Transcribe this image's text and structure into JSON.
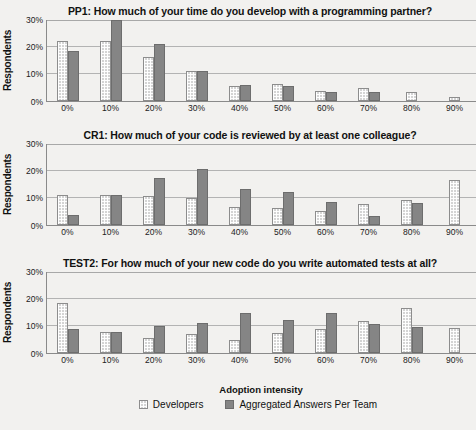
{
  "figure": {
    "axis_title": "Adoption intensity",
    "y_axis_title": "Respondents",
    "y_ticks": [
      "0%",
      "10%",
      "20%",
      "30%"
    ],
    "legend": [
      {
        "label": "Developers",
        "swatch": "light-dotted",
        "color": "#d4d4d4"
      },
      {
        "label": "Aggregated Answers Per Team",
        "swatch": "dark-solid",
        "color": "#858585"
      }
    ]
  },
  "chart_data": [
    {
      "type": "bar",
      "title": "PP1: How much of your time do you develop with a programming partner?",
      "xlabel": "Adoption intensity",
      "ylabel": "Respondents",
      "ylim": [
        0,
        30
      ],
      "yticks": [
        0,
        10,
        20,
        30
      ],
      "grid": true,
      "legend_position": "bottom",
      "categories": [
        "0%",
        "10%",
        "20%",
        "30%",
        "40%",
        "50%",
        "60%",
        "70%",
        "80%",
        "90%"
      ],
      "series": [
        {
          "name": "Developers",
          "values": [
            22.0,
            22.2,
            16.0,
            10.8,
            5.2,
            6.3,
            3.7,
            4.5,
            3.0,
            1.2
          ]
        },
        {
          "name": "Aggregated Answers Per Team",
          "values": [
            18.5,
            30.0,
            21.0,
            10.8,
            5.6,
            5.5,
            3.0,
            3.0,
            0,
            0
          ]
        }
      ]
    },
    {
      "type": "bar",
      "title": "CR1: How much of your code is reviewed by at least one colleague?",
      "xlabel": "Adoption intensity",
      "ylabel": "Respondents",
      "ylim": [
        0,
        30
      ],
      "yticks": [
        0,
        10,
        20,
        30
      ],
      "grid": true,
      "legend_position": "bottom",
      "categories": [
        "0%",
        "10%",
        "20%",
        "30%",
        "40%",
        "50%",
        "60%",
        "70%",
        "80%",
        "90%"
      ],
      "series": [
        {
          "name": "Developers",
          "values": [
            11.1,
            11.0,
            10.7,
            9.9,
            6.5,
            6.3,
            5.0,
            7.7,
            9.2,
            16.5
          ]
        },
        {
          "name": "Aggregated Answers Per Team",
          "values": [
            3.7,
            11.0,
            17.1,
            20.7,
            13.2,
            11.9,
            8.2,
            3.0,
            8.0,
            0
          ]
        }
      ]
    },
    {
      "type": "bar",
      "title": "TEST2: For how much of your new code do you write automated tests at all?",
      "xlabel": "Adoption intensity",
      "ylabel": "Respondents",
      "ylim": [
        0,
        30
      ],
      "yticks": [
        0,
        10,
        20,
        30
      ],
      "grid": true,
      "legend_position": "bottom",
      "categories": [
        "0%",
        "10%",
        "20%",
        "30%",
        "40%",
        "50%",
        "60%",
        "70%",
        "80%",
        "90%"
      ],
      "series": [
        {
          "name": "Developers",
          "values": [
            18.2,
            7.5,
            5.3,
            7.0,
            4.7,
            7.1,
            8.8,
            11.8,
            16.5,
            9.0
          ]
        },
        {
          "name": "Aggregated Answers Per Team",
          "values": [
            8.7,
            7.5,
            9.8,
            11.0,
            14.5,
            11.9,
            14.5,
            10.7,
            9.3,
            0
          ]
        }
      ]
    }
  ]
}
